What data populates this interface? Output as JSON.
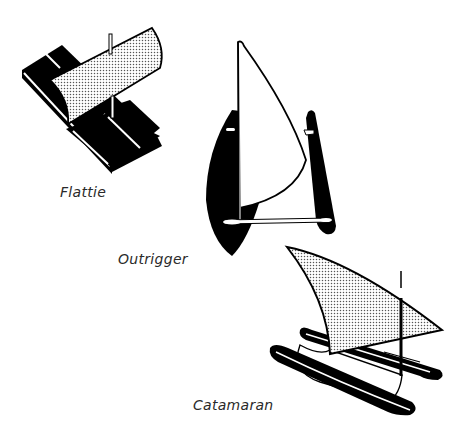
{
  "figure": {
    "boats": [
      {
        "id": "flattie",
        "label": "Flattie",
        "sail_style": "dotted"
      },
      {
        "id": "outrigger",
        "label": "Outrigger",
        "sail_style": "white"
      },
      {
        "id": "catamaran",
        "label": "Catamaran",
        "sail_style": "dotted"
      }
    ],
    "colors": {
      "ink": "#000000",
      "paper": "#ffffff",
      "sail_dots": "#555555",
      "label_text": "#2a2a2a"
    }
  }
}
